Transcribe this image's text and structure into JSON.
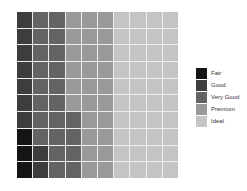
{
  "chart_data": {
    "type": "waffle",
    "title": "",
    "grid": {
      "rows": 10,
      "cols": 10
    },
    "categories": [
      "Fair",
      "Good",
      "Very Good",
      "Premium",
      "Ideal"
    ],
    "values": [
      3,
      9,
      22,
      26,
      40
    ],
    "colors": [
      "#151515",
      "#3d3d3d",
      "#636363",
      "#9a9a9a",
      "#c4c4c4"
    ],
    "fill_order": "column-wise from bottom-left",
    "legend_position": "right"
  },
  "legend": {
    "items": [
      {
        "label": "Fair",
        "color": "#151515"
      },
      {
        "label": "Good",
        "color": "#3d3d3d"
      },
      {
        "label": "Very Good",
        "color": "#636363"
      },
      {
        "label": "Premium",
        "color": "#9a9a9a"
      },
      {
        "label": "Ideal",
        "color": "#c4c4c4"
      }
    ]
  }
}
